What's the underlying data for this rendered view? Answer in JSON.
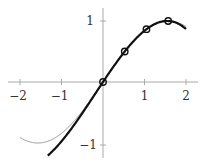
{
  "chart_data": {
    "type": "line",
    "title": "",
    "xlabel": "",
    "ylabel": "",
    "xlim": [
      -2,
      2
    ],
    "ylim": [
      -1.2,
      1.2
    ],
    "grid": false,
    "legend": null,
    "x_ticks": [
      "−2",
      "−1",
      "1",
      "2"
    ],
    "y_ticks": [
      "1",
      "−1"
    ],
    "series": [
      {
        "name": "sin(x)",
        "style": "thin gray",
        "color": "#999999",
        "x": [
          -2.0,
          -1.5708,
          -1.0,
          -0.5,
          0.0,
          0.5,
          1.0,
          1.5708,
          2.0
        ],
        "y": [
          -0.909,
          -1.0,
          -0.841,
          -0.479,
          0.0,
          0.479,
          0.841,
          1.0,
          0.909
        ]
      },
      {
        "name": "cubic interpolant",
        "style": "thick black",
        "color": "#111111",
        "x": [
          -1.33,
          -1.0,
          -0.5,
          0.0,
          0.5236,
          1.0472,
          1.5708,
          2.0
        ],
        "y": [
          -1.206,
          -0.929,
          -0.478,
          0.0,
          0.5,
          0.866,
          1.0,
          0.868
        ]
      },
      {
        "name": "interpolation nodes",
        "style": "circle markers",
        "color": "#111111",
        "x": [
          0.0,
          0.5236,
          1.0472,
          1.5708
        ],
        "y": [
          0.0,
          0.5,
          0.866,
          1.0
        ]
      }
    ]
  },
  "axes": {
    "x_tick_labels": [
      "−2",
      "−1",
      "1",
      "2"
    ],
    "y_tick_labels": [
      "1",
      "−1"
    ]
  }
}
